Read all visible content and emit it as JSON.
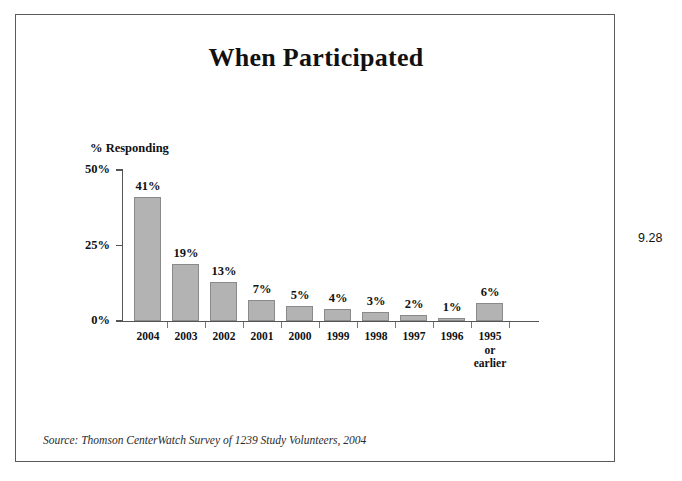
{
  "slide": {
    "title": "When Participated",
    "page_number": "9.28",
    "source_note": "Source: Thomson CenterWatch Survey of 1239 Study Volunteers, 2004",
    "background_color": "#ffffff",
    "border_color": "#5a5a5a"
  },
  "chart_data": {
    "type": "bar",
    "title": "When Participated",
    "xlabel": "",
    "ylabel": "% Responding",
    "categories": [
      "2004",
      "2003",
      "2002",
      "2001",
      "2000",
      "1999",
      "1998",
      "1997",
      "1996",
      "1995\nor\nearlier"
    ],
    "category_lines": [
      [
        "2004"
      ],
      [
        "2003"
      ],
      [
        "2002"
      ],
      [
        "2001"
      ],
      [
        "2000"
      ],
      [
        "1999"
      ],
      [
        "1998"
      ],
      [
        "1997"
      ],
      [
        "1996"
      ],
      [
        "1995",
        "or",
        "earlier"
      ]
    ],
    "values": [
      41,
      19,
      13,
      7,
      5,
      4,
      3,
      2,
      1,
      6
    ],
    "data_labels": [
      "41%",
      "19%",
      "13%",
      "7%",
      "5%",
      "4%",
      "3%",
      "2%",
      "1%",
      "6%"
    ],
    "ylim": [
      0,
      50
    ],
    "yticks": [
      0,
      25,
      50
    ],
    "ytick_labels": [
      "0%",
      "25%",
      "50%"
    ],
    "grid": false,
    "legend": null,
    "bar_color": "#b3b3b3",
    "bar_border_color": "#8a8a8a",
    "axis_color": "#555555"
  }
}
